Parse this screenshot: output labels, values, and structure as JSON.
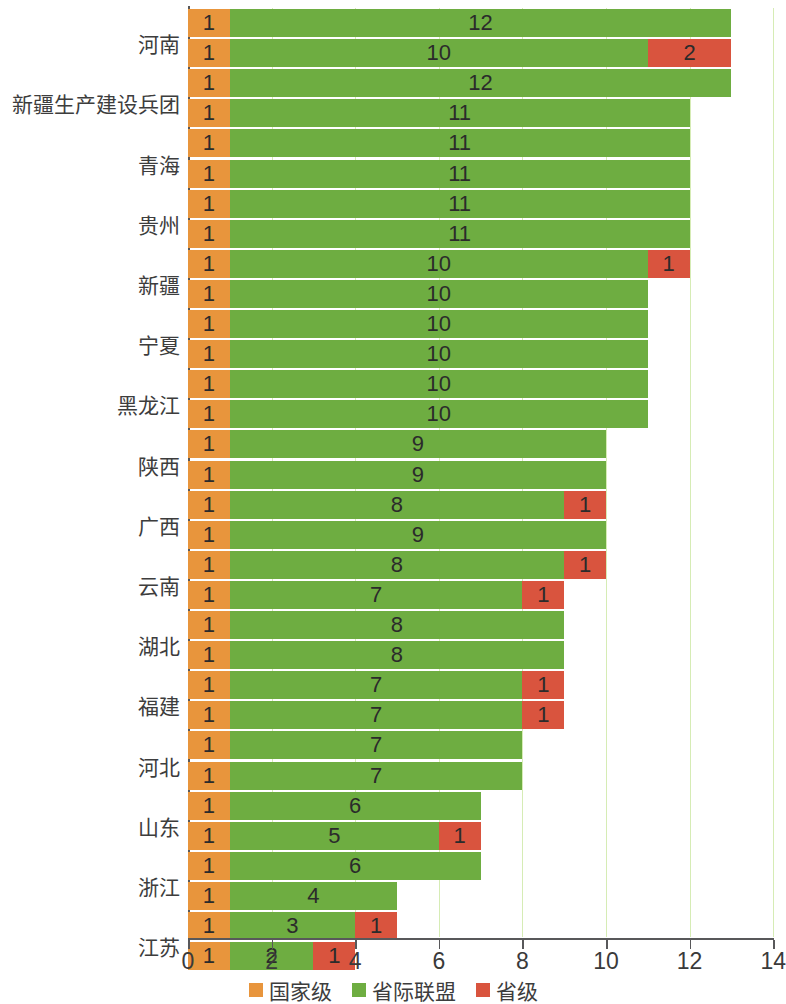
{
  "chart_data": {
    "type": "bar",
    "orientation": "horizontal",
    "stacked": true,
    "title": "",
    "xlabel": "",
    "ylabel": "",
    "xlim": [
      0,
      14
    ],
    "xticks": [
      0,
      2,
      4,
      6,
      8,
      10,
      12,
      14
    ],
    "xtick_labels": [
      "0",
      "2",
      "4",
      "6",
      "8",
      "10",
      "12",
      "14"
    ],
    "grid": true,
    "legend_position": "bottom",
    "series": [
      {
        "name": "国家级",
        "color": "#e8953c",
        "values": [
          1,
          1,
          1,
          1,
          1,
          1,
          1,
          1,
          1,
          1,
          1,
          1,
          1,
          1,
          1,
          1,
          1,
          1,
          1,
          1,
          1,
          1,
          1,
          1,
          1,
          1,
          1,
          1,
          1,
          1
        ]
      },
      {
        "name": "省际联盟",
        "color": "#6ead41",
        "values": [
          12,
          10,
          12,
          11,
          11,
          11,
          11,
          10,
          10,
          10,
          10,
          10,
          10,
          9,
          9,
          8,
          9,
          8,
          7,
          8,
          8,
          7,
          7,
          7,
          7,
          6,
          5,
          6,
          4,
          3,
          2
        ]
      },
      {
        "name": "省级",
        "color": "#d9543e",
        "values": [
          0,
          2,
          0,
          0,
          0,
          0,
          0,
          1,
          0,
          0,
          0,
          0,
          0,
          0,
          0,
          1,
          0,
          1,
          1,
          0,
          0,
          1,
          1,
          0,
          0,
          0,
          1,
          0,
          0,
          1,
          1
        ]
      }
    ],
    "rows": [
      {
        "label": "",
        "national": 1,
        "alliance": 12,
        "provincial": 0
      },
      {
        "label": "河南",
        "national": 1,
        "alliance": 10,
        "provincial": 2
      },
      {
        "label": "",
        "national": 1,
        "alliance": 12,
        "provincial": 0
      },
      {
        "label": "新疆生产建设兵团",
        "national": 1,
        "alliance": 11,
        "provincial": 0
      },
      {
        "label": "",
        "national": 1,
        "alliance": 11,
        "provincial": 0
      },
      {
        "label": "青海",
        "national": 1,
        "alliance": 11,
        "provincial": 0
      },
      {
        "label": "",
        "national": 1,
        "alliance": 11,
        "provincial": 0
      },
      {
        "label": "贵州",
        "national": 1,
        "alliance": 11,
        "provincial": 0
      },
      {
        "label": "",
        "national": 1,
        "alliance": 10,
        "provincial": 1
      },
      {
        "label": "新疆",
        "national": 1,
        "alliance": 10,
        "provincial": 0
      },
      {
        "label": "",
        "national": 1,
        "alliance": 10,
        "provincial": 0
      },
      {
        "label": "宁夏",
        "national": 1,
        "alliance": 10,
        "provincial": 0
      },
      {
        "label": "",
        "national": 1,
        "alliance": 10,
        "provincial": 0
      },
      {
        "label": "黑龙江",
        "national": 1,
        "alliance": 10,
        "provincial": 0
      },
      {
        "label": "",
        "national": 1,
        "alliance": 9,
        "provincial": 0
      },
      {
        "label": "陕西",
        "national": 1,
        "alliance": 9,
        "provincial": 0
      },
      {
        "label": "",
        "national": 1,
        "alliance": 8,
        "provincial": 1
      },
      {
        "label": "广西",
        "national": 1,
        "alliance": 9,
        "provincial": 0
      },
      {
        "label": "",
        "national": 1,
        "alliance": 8,
        "provincial": 1
      },
      {
        "label": "云南",
        "national": 1,
        "alliance": 7,
        "provincial": 1
      },
      {
        "label": "",
        "national": 1,
        "alliance": 8,
        "provincial": 0
      },
      {
        "label": "湖北",
        "national": 1,
        "alliance": 8,
        "provincial": 0
      },
      {
        "label": "",
        "national": 1,
        "alliance": 7,
        "provincial": 1
      },
      {
        "label": "福建",
        "national": 1,
        "alliance": 7,
        "provincial": 1
      },
      {
        "label": "",
        "national": 1,
        "alliance": 7,
        "provincial": 0
      },
      {
        "label": "河北",
        "national": 1,
        "alliance": 7,
        "provincial": 0
      },
      {
        "label": "",
        "national": 1,
        "alliance": 6,
        "provincial": 0
      },
      {
        "label": "山东",
        "national": 1,
        "alliance": 5,
        "provincial": 1
      },
      {
        "label": "",
        "national": 1,
        "alliance": 6,
        "provincial": 0
      },
      {
        "label": "浙江",
        "national": 1,
        "alliance": 4,
        "provincial": 0
      },
      {
        "label": "",
        "national": 1,
        "alliance": 3,
        "provincial": 1
      },
      {
        "label": "江苏",
        "national": 1,
        "alliance": 2,
        "provincial": 1
      }
    ]
  },
  "legend": {
    "items": [
      {
        "label": "国家级",
        "color": "#e8953c"
      },
      {
        "label": "省际联盟",
        "color": "#6ead41"
      },
      {
        "label": "省级",
        "color": "#d9543e"
      }
    ]
  },
  "colors": {
    "national": "#e8953c",
    "alliance": "#6ead41",
    "provincial": "#d9543e",
    "axis": "#58585a",
    "text": "#3d3d3d",
    "background": "#ffffff"
  }
}
